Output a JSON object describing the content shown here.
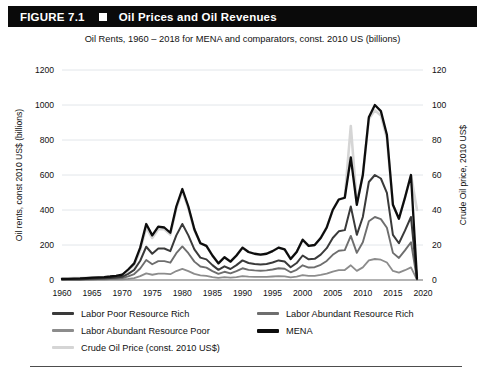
{
  "header": {
    "figure_label": "FIGURE 7.1",
    "square_icon": "filled-square-icon",
    "title": "Oil Prices and Oil Revenues"
  },
  "subtitle": "Oil Rents, 1960 – 2018 for MENA and comparators, const. 2010 US (billions)",
  "chart_data": {
    "type": "line",
    "title": "Oil Prices and Oil Revenues",
    "subtitle": "Oil Rents, 1960 – 2018 for MENA and comparators, const. 2010 US (billions)",
    "xlabel": "",
    "ylabel": "Oil rents, const 2010 US$ (billions)",
    "y2label": "Crude Oil price, 2010 US$",
    "xlim": [
      1960,
      2020
    ],
    "ylim": [
      0,
      1200
    ],
    "y2lim": [
      0,
      120
    ],
    "xticks": [
      1960,
      1965,
      1970,
      1975,
      1980,
      1985,
      1990,
      1995,
      2000,
      2005,
      2010,
      2015,
      2020
    ],
    "yticks": [
      0,
      200,
      400,
      600,
      800,
      1000,
      1200
    ],
    "y2ticks": [
      0,
      20,
      40,
      60,
      80,
      100,
      120
    ],
    "grid": true,
    "legend_position": "below",
    "x": [
      1960,
      1961,
      1962,
      1963,
      1964,
      1965,
      1966,
      1967,
      1968,
      1969,
      1970,
      1971,
      1972,
      1973,
      1974,
      1975,
      1976,
      1977,
      1978,
      1979,
      1980,
      1981,
      1982,
      1983,
      1984,
      1985,
      1986,
      1987,
      1988,
      1989,
      1990,
      1991,
      1992,
      1993,
      1994,
      1995,
      1996,
      1997,
      1998,
      1999,
      2000,
      2001,
      2002,
      2003,
      2004,
      2005,
      2006,
      2007,
      2008,
      2009,
      2010,
      2011,
      2012,
      2013,
      2014,
      2015,
      2016,
      2017,
      2018,
      2019
    ],
    "series": [
      {
        "name": "MENA",
        "axis": "left",
        "color": "#0d0d0d",
        "width": 2.3,
        "values": [
          6,
          7,
          8,
          9,
          11,
          13,
          15,
          17,
          20,
          24,
          30,
          60,
          95,
          185,
          320,
          255,
          305,
          300,
          270,
          420,
          520,
          420,
          290,
          210,
          195,
          140,
          95,
          130,
          105,
          140,
          185,
          160,
          150,
          145,
          150,
          165,
          185,
          175,
          120,
          160,
          230,
          195,
          200,
          240,
          300,
          400,
          460,
          470,
          700,
          430,
          600,
          930,
          1000,
          965,
          830,
          430,
          350,
          470,
          600,
          10
        ]
      },
      {
        "name": "Labor Poor Resource Rich",
        "axis": "left",
        "color": "#3a3a3a",
        "width": 2.0,
        "values": [
          3,
          4,
          4,
          5,
          6,
          7,
          8,
          10,
          12,
          14,
          18,
          35,
          58,
          110,
          190,
          150,
          180,
          180,
          165,
          255,
          320,
          255,
          175,
          128,
          118,
          85,
          58,
          78,
          63,
          85,
          112,
          97,
          91,
          88,
          91,
          100,
          112,
          106,
          73,
          97,
          140,
          118,
          121,
          145,
          182,
          240,
          278,
          285,
          420,
          258,
          360,
          560,
          600,
          580,
          498,
          258,
          210,
          282,
          360,
          6
        ]
      },
      {
        "name": "Labor Abundant Resource Rich",
        "axis": "left",
        "color": "#6e6e6e",
        "width": 1.9,
        "values": [
          2,
          2,
          3,
          3,
          4,
          4,
          5,
          6,
          7,
          9,
          11,
          21,
          34,
          66,
          114,
          90,
          108,
          108,
          99,
          153,
          192,
          153,
          105,
          77,
          71,
          51,
          35,
          47,
          38,
          51,
          67,
          58,
          55,
          53,
          55,
          60,
          67,
          64,
          44,
          58,
          84,
          71,
          73,
          87,
          109,
          144,
          167,
          171,
          252,
          155,
          216,
          336,
          360,
          348,
          299,
          155,
          126,
          169,
          216,
          4
        ]
      },
      {
        "name": "Labor Abundant Resource Poor",
        "axis": "left",
        "color": "#8c8c8c",
        "width": 1.8,
        "values": [
          1,
          1,
          1,
          1,
          1,
          2,
          2,
          2,
          3,
          3,
          4,
          7,
          11,
          22,
          38,
          30,
          36,
          36,
          33,
          51,
          64,
          51,
          35,
          26,
          24,
          17,
          12,
          16,
          13,
          17,
          22,
          19,
          18,
          18,
          18,
          20,
          22,
          21,
          15,
          19,
          28,
          24,
          24,
          29,
          36,
          48,
          56,
          57,
          84,
          52,
          72,
          112,
          120,
          116,
          100,
          52,
          42,
          56,
          72,
          2
        ]
      },
      {
        "name": "Crude Oil Price (const. 2010 US$)",
        "axis": "right",
        "color": "#d5d5d5",
        "width": 2.6,
        "values": [
          1.0,
          1.0,
          1.1,
          1.1,
          1.2,
          1.3,
          1.4,
          1.6,
          1.9,
          2.3,
          2.8,
          5.5,
          8.5,
          17.0,
          30.0,
          24.0,
          29.0,
          29.0,
          26.0,
          41.0,
          51.0,
          41.0,
          28.5,
          21.0,
          19.5,
          14.0,
          9.5,
          13.0,
          10.5,
          14.0,
          18.5,
          16.0,
          15.0,
          14.5,
          15.0,
          16.5,
          18.5,
          17.5,
          12.0,
          16.0,
          23.0,
          19.5,
          20.0,
          24.0,
          30.0,
          40.0,
          46.0,
          47.0,
          88.0,
          44.0,
          60.0,
          92.0,
          97.0,
          94.0,
          81.0,
          43.0,
          35.0,
          47.0,
          60.0,
          40.0
        ]
      }
    ]
  },
  "legend": {
    "items": [
      {
        "label": "Labor Poor Resource Rich",
        "color": "#3a3a3a",
        "thickness": 3
      },
      {
        "label": "Labor Abundant Resource Rich",
        "color": "#6e6e6e",
        "thickness": 3
      },
      {
        "label": "Labor Abundant Resource Poor",
        "color": "#8c8c8c",
        "thickness": 3
      },
      {
        "label": "MENA",
        "color": "#0d0d0d",
        "thickness": 4
      },
      {
        "label": "Crude Oil Price (const. 2010 US$)",
        "color": "#d5d5d5",
        "thickness": 3
      }
    ]
  }
}
